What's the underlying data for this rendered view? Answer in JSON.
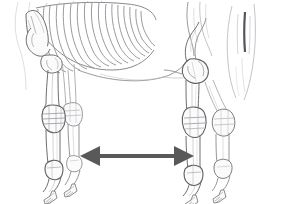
{
  "figure": {
    "view": "left lateral",
    "style": "pencil line drawing",
    "background_color": "#ffffff",
    "bone_line_color": "#6e6e73",
    "bone_line_color_light": "#a8a8ad",
    "bone_line_color_faint": "#c8c8cd",
    "outline_color": "#8a8a90",
    "bone_fill": "#fbfbfc",
    "alt_text": "Pencil-style anatomical drawing of a horse skeleton seen from the side, showing the ribcage, shoulder blade, both forelegs and both hind legs with hooves, and the tail. A dark gray double-headed arrow spans horizontally between the forelegs and the hind legs."
  },
  "canvas": {
    "width": 284,
    "height": 204
  },
  "arrow": {
    "label": "body-length-measure-arrow",
    "type": "double-headed",
    "orientation": "horizontal",
    "color": "#595959",
    "x_start": 80,
    "x_end": 194,
    "y_center": 156,
    "shaft_thickness": 4,
    "head_length": 20,
    "head_half_height": 10
  },
  "parts": [
    {
      "id": "ribcage",
      "label": "Ribcage",
      "rib_count": 17
    },
    {
      "id": "scapula",
      "label": "Shoulder blade (scapula)"
    },
    {
      "id": "humerus",
      "label": "Upper foreleg bone (humerus)"
    },
    {
      "id": "foreleg-near",
      "label": "Near foreleg"
    },
    {
      "id": "foreleg-far",
      "label": "Far foreleg"
    },
    {
      "id": "carpus",
      "label": "Knee (carpus)"
    },
    {
      "id": "fore-fetlock",
      "label": "Front fetlock"
    },
    {
      "id": "fore-hoof",
      "label": "Front hoof"
    },
    {
      "id": "stifle",
      "label": "Stifle joint"
    },
    {
      "id": "femur",
      "label": "Thigh bone (femur)"
    },
    {
      "id": "hock",
      "label": "Hock"
    },
    {
      "id": "hindleg-near",
      "label": "Near hind leg"
    },
    {
      "id": "hindleg-far",
      "label": "Far hind leg"
    },
    {
      "id": "hind-fetlock",
      "label": "Hind fetlock"
    },
    {
      "id": "hind-hoof",
      "label": "Hind hoof"
    },
    {
      "id": "tail",
      "label": "Tail"
    },
    {
      "id": "belly-line",
      "label": "Belly and flank outline"
    }
  ]
}
